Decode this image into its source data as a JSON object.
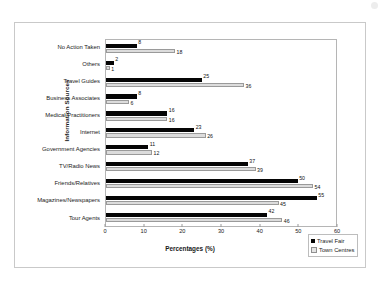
{
  "chart_data": {
    "type": "bar",
    "orientation": "horizontal",
    "title": "",
    "xlabel": "Percentages (%)",
    "ylabel": "Information Sources",
    "xlim": [
      0,
      60
    ],
    "xticks": [
      0,
      10,
      20,
      30,
      40,
      50,
      60
    ],
    "grid": false,
    "legend_position": "bottom-right",
    "categories": [
      "No Action Taken",
      "Others",
      "Travel Guides",
      "Business Associates",
      "Medical Practitioners",
      "Internet",
      "Government Agencies",
      "TV/Radio News",
      "Friends/Relatives",
      "Magazines/Newspapers",
      "Tour Agents"
    ],
    "series": [
      {
        "name": "Travel Fair",
        "color": "#050505",
        "values": [
          8,
          2,
          25,
          8,
          16,
          23,
          11,
          37,
          50,
          55,
          42
        ]
      },
      {
        "name": "Town Centres",
        "color": "#dcdcdc",
        "values": [
          18,
          1,
          36,
          6,
          16,
          26,
          12,
          39,
          54,
          45,
          46
        ]
      }
    ]
  },
  "legend": {
    "items": [
      {
        "label": "Travel Fair"
      },
      {
        "label": "Town Centres"
      }
    ]
  }
}
